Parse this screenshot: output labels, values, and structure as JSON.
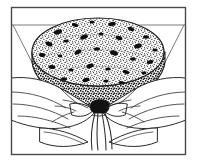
{
  "image": {
    "type": "line-and-stipple-illustration",
    "style": "black-and-white engraving / cookbook technique illustration",
    "alt_text": "Two hands gathering a pudding cloth around a round speckled steamed pudding and tying it with string",
    "subject": "hands tying a pudding cloth around a steamed fruit pudding",
    "background_color": "#ffffff",
    "ink_color": "#1a1a1a",
    "frame": {
      "visible": true,
      "shape": "rectangle",
      "stroke_color": "#4a4a4a",
      "stroke_width_px": 1,
      "x": 11,
      "y": 7,
      "width": 175,
      "height": 148
    },
    "scene": {
      "background_lines": [
        {
          "name": "counter-edge-left",
          "orientation": "horizontal",
          "x1": 12,
          "y1": 25,
          "x2": 62,
          "y2": 25
        },
        {
          "name": "counter-edge-right",
          "orientation": "horizontal",
          "x1": 140,
          "y1": 25,
          "x2": 185,
          "y2": 25
        },
        {
          "name": "wall-corner-left",
          "orientation": "diagonal",
          "x1": 12,
          "y1": 25,
          "x2": 44,
          "y2": 86
        },
        {
          "name": "wall-corner-right",
          "orientation": "diagonal",
          "x1": 185,
          "y1": 25,
          "x2": 152,
          "y2": 86
        }
      ],
      "pudding": {
        "name": "steamed-pudding",
        "shape": "round dome, flat top, tapering base",
        "texture": "dense stipple with dark currant speckles",
        "center_x": 98,
        "center_y": 52,
        "radius_x": 66,
        "radius_y": 34,
        "speckle_color": "#111111",
        "shadow_side": "lower-left"
      },
      "cloth": {
        "name": "pudding-cloth",
        "description": "white cloth gathered and pleated beneath the pudding",
        "fold_count": 9
      },
      "knot": {
        "name": "string-knot",
        "x": 100,
        "y": 110,
        "color": "#111111"
      },
      "strings": {
        "name": "hanging-string-ends",
        "count": 4,
        "top_x": 100,
        "top_y": 112,
        "bottom_y": 150
      },
      "hands": [
        {
          "name": "left-hand",
          "side": "left",
          "pose": "fingers curled around gathered cloth",
          "x": 14,
          "y": 72,
          "width": 84,
          "height": 70
        },
        {
          "name": "right-hand",
          "side": "right",
          "pose": "fingers curled around gathered cloth",
          "x": 99,
          "y": 72,
          "width": 84,
          "height": 70
        }
      ]
    }
  }
}
